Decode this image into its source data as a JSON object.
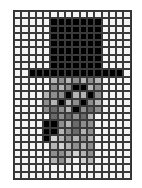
{
  "grid": {
    "columns": 16,
    "rows": 23,
    "palette": {
      "W": "#f4f4f4",
      "K": "#000000",
      "D": "#6a6a6a",
      "M": "#8e8e8e",
      "L": "#b4b4b4",
      "P": "#d2d2d2"
    },
    "pixels": [
      "WWWWWWWWWWWWWWWW",
      "WWWWWKKKKKKKWWWW",
      "WWWWWKKKKKKKWWWW",
      "WWWWWKKKKKKKWWWW",
      "WWWWWKKKKKKKWWWW",
      "WWWWWKKKKKKKWWWW",
      "WWWWWKKKKKKKWWWW",
      "WWWWWKKKKKKKWWWW",
      "WWKKKKKKKKKKKKKW",
      "WWWWWLMLMLMLWWWW",
      "WWWWWMLMKKLMWWWW",
      "WWWWLMMKLLKMWWWW",
      "WWWWMLKLMKMLWWWW",
      "WWWWMDMLKMDMWWWW",
      "WWWWWDMDMDLWWWWW",
      "WWWWKKMLDMMWWWWW",
      "WWWWKKLMDLMWWWWW",
      "WWWWKPLMLMLWWWWW",
      "WWWWWLPLMLMWWWWW",
      "WWWWWMMLPLMWWWWW",
      "WWWWWLMPWPLWWWWW",
      "WWWWWWWWWWWWWWWW",
      "WWWWWWWWWWWWWWWW"
    ]
  }
}
